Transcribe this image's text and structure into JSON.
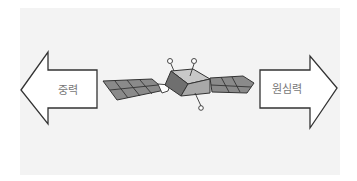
{
  "diagram": {
    "title": "",
    "left_arrow": {
      "label": "중력",
      "direction": "left",
      "meaning": "gravity"
    },
    "right_arrow": {
      "label": "원심력",
      "direction": "right",
      "meaning": "centrifugal force"
    },
    "center_object": {
      "icon": "satellite-icon"
    },
    "colors": {
      "background": "#f3f3f3",
      "arrow_fill": "#ffffff",
      "outline": "#333333",
      "panel_fill": "#8a8a8a",
      "body_light": "#c8c8c8",
      "body_mid": "#a8a8a8",
      "body_dark": "#6f6f6f",
      "label_text": "#777777"
    }
  }
}
